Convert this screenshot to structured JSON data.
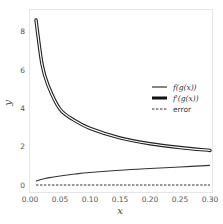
{
  "chart_data": {
    "type": "line",
    "title": "",
    "xlabel": "x",
    "ylabel": "y",
    "xlim": [
      0.0,
      0.3
    ],
    "ylim": [
      -0.4,
      9.0
    ],
    "grid": false,
    "legend_position": "center right",
    "xticks": [
      "0.00",
      "0.05",
      "0.10",
      "0.15",
      "0.20",
      "0.25",
      "0.30"
    ],
    "yticks": [
      "0",
      "2",
      "4",
      "6",
      "8"
    ],
    "x": [
      0.01,
      0.02,
      0.03,
      0.05,
      0.075,
      0.1,
      0.15,
      0.2,
      0.25,
      0.3
    ],
    "series": [
      {
        "name": "f(g(x))",
        "style": "solid-thin",
        "values": [
          0.2,
          0.3,
          0.37,
          0.47,
          0.57,
          0.65,
          0.77,
          0.86,
          0.94,
          1.02
        ]
      },
      {
        "name": "f'(g(x))",
        "style": "solid-thick-outlined",
        "values": [
          8.6,
          6.3,
          5.2,
          3.95,
          3.35,
          2.95,
          2.45,
          2.15,
          1.95,
          1.8
        ]
      },
      {
        "name": "error",
        "style": "dashed",
        "values": [
          0,
          0,
          0,
          0,
          0,
          0,
          0,
          0,
          0,
          0
        ]
      }
    ]
  },
  "legend": {
    "items": [
      {
        "label": "f(g(x))"
      },
      {
        "label": "f'(g(x))"
      },
      {
        "label": "error"
      }
    ]
  },
  "axes": {
    "xlabel": "x",
    "ylabel": "y"
  }
}
